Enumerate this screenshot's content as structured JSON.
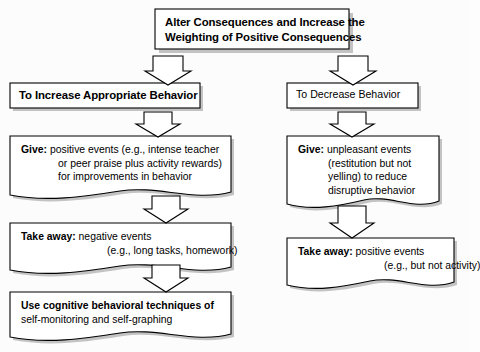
{
  "diagram": {
    "title_box": {
      "line1": "Alter Consequences and Increase the",
      "line2": "Weighting of Positive Consequences"
    },
    "branches": [
      {
        "header": "To Increase Appropriate Behavior",
        "steps": [
          {
            "lead": "Give:",
            "lines": [
              " positive events (e.g., intense teacher",
              "or peer praise plus activity rewards)",
              "for improvements in behavior"
            ]
          },
          {
            "lead": "Take away:",
            "lines": [
              " negative events",
              "(e.g., long tasks, homework)"
            ]
          },
          {
            "lead": "Use cognitive behavioral techniques of",
            "lines": [
              "self-monitoring and self-graphing"
            ]
          }
        ]
      },
      {
        "header": "To Decrease Behavior",
        "steps": [
          {
            "lead": "Give:",
            "lines": [
              " unpleasant events",
              "(restitution but not",
              "yelling) to reduce",
              "disruptive behavior"
            ]
          },
          {
            "lead": "Take away:",
            "lines": [
              " positive events",
              "(e.g., but not activity)"
            ]
          }
        ]
      }
    ],
    "connectors": [
      {
        "name": "arrow-title-to-left-header"
      },
      {
        "name": "arrow-title-to-right-header"
      },
      {
        "name": "arrow-left-header-to-give"
      },
      {
        "name": "arrow-left-give-to-takeaway"
      },
      {
        "name": "arrow-left-takeaway-to-cognitive"
      },
      {
        "name": "arrow-right-header-to-give"
      },
      {
        "name": "arrow-right-give-to-takeaway"
      }
    ],
    "colors": {
      "box_fill": "#ffffff",
      "box_stroke": "#000000",
      "shadow": "#b9b9b9",
      "background": "#fcfcfc",
      "text": "#000000"
    }
  }
}
